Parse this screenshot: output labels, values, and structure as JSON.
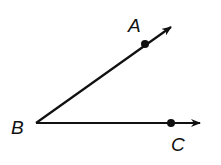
{
  "diagram": {
    "type": "angle",
    "colors": {
      "stroke": "#111111",
      "background": "#ffffff"
    },
    "vertex": {
      "label": "B",
      "x": 36,
      "y": 123
    },
    "rays": [
      {
        "name": "ray-BA",
        "point": {
          "label": "A",
          "x": 145,
          "y": 44
        },
        "tip": {
          "x": 172,
          "y": 26
        }
      },
      {
        "name": "ray-BC",
        "point": {
          "label": "C",
          "x": 171,
          "y": 123
        },
        "tip": {
          "x": 201,
          "y": 123
        }
      }
    ],
    "labels": {
      "A": "A",
      "B": "B",
      "C": "C"
    }
  }
}
